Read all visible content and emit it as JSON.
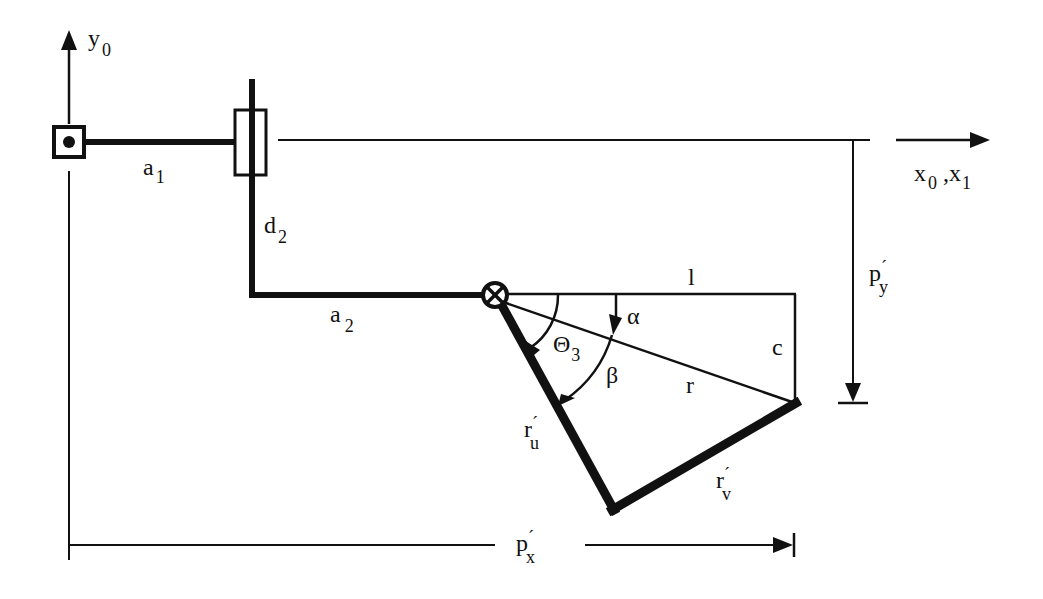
{
  "diagram": {
    "type": "robot-arm-kinematics",
    "colors": {
      "ink": "#111111",
      "background": "#ffffff"
    },
    "axes": {
      "y_axis": {
        "base": "y",
        "sub": "0"
      },
      "x_axis": {
        "base": "x",
        "sub": "0",
        "sep": " ,",
        "base2": "x",
        "sub2": "1"
      }
    },
    "links": {
      "a1": {
        "base": "a",
        "sub": "1"
      },
      "d2": {
        "base": "d",
        "sub": "2"
      },
      "a2": {
        "base": "a",
        "sub": "2"
      },
      "ru": {
        "base": "r",
        "prime": "´",
        "sub": "u"
      },
      "rv": {
        "base": "r",
        "prime": "´",
        "sub": "v"
      }
    },
    "geometry_labels": {
      "l": "l",
      "c": "c",
      "r": "r",
      "alpha": "α",
      "beta": "β",
      "theta3": {
        "base": "Θ",
        "sub": "3"
      }
    },
    "dimensions": {
      "px": {
        "base": "p",
        "prime": "´",
        "sub": "x"
      },
      "py": {
        "base": "p",
        "prime": "´",
        "sub": "y"
      }
    },
    "joints": [
      {
        "name": "revolute-joint-1",
        "symbol": "dot-in-square"
      },
      {
        "name": "prismatic-joint-2",
        "symbol": "slider"
      },
      {
        "name": "revolute-joint-3",
        "symbol": "circle-x"
      }
    ]
  }
}
